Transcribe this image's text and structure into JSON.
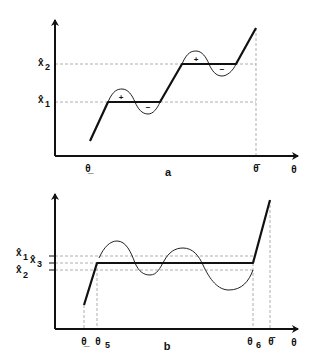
{
  "panel_a": {
    "caption": "a",
    "x_axis_label": "θ",
    "x_ticks": [
      {
        "label": "θ̲",
        "name": "theta-lower"
      },
      {
        "label": "θ̄",
        "name": "theta-upper"
      }
    ],
    "y_ticks": [
      {
        "label": "x̂",
        "sub": "1"
      },
      {
        "label": "x̂",
        "sub": "2"
      }
    ],
    "wave_signs": [
      "+",
      "−",
      "+",
      "−"
    ]
  },
  "panel_b": {
    "caption": "b",
    "x_axis_label": "θ",
    "x_ticks": [
      {
        "label": "θ̲",
        "sub": ""
      },
      {
        "label": "θ",
        "sub": "5"
      },
      {
        "label": "θ",
        "sub": "6"
      },
      {
        "label": "θ̄",
        "sub": ""
      }
    ],
    "y_ticks": [
      {
        "label": "x̂",
        "sub": "1"
      },
      {
        "label": "x̂",
        "sub": "3"
      },
      {
        "label": "x̂",
        "sub": "2"
      }
    ]
  },
  "colors": {
    "curve": "#111111",
    "guide": "#999999",
    "background": "#ffffff"
  }
}
